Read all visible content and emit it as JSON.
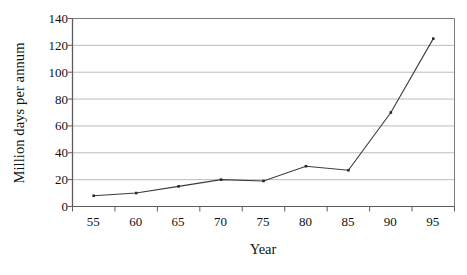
{
  "chart_data": {
    "type": "line",
    "title": "",
    "xlabel": "Year",
    "ylabel": "Million days per annum",
    "categories": [
      "55",
      "60",
      "65",
      "70",
      "75",
      "80",
      "85",
      "90",
      "95"
    ],
    "values": [
      8,
      10,
      15,
      20,
      19,
      30,
      27,
      70,
      125
    ],
    "series": [
      {
        "name": "Million days per annum",
        "values": [
          8,
          10,
          15,
          20,
          19,
          30,
          27,
          70,
          125
        ]
      }
    ],
    "ylim": [
      0,
      140
    ],
    "yticks": [
      0,
      20,
      40,
      60,
      80,
      100,
      120,
      140
    ],
    "ytick_labels": [
      "0",
      "20",
      "40",
      "60",
      "80",
      "100",
      "120",
      "140"
    ],
    "grid": true,
    "grid_axis": "y",
    "legend": false,
    "legend_position": "none",
    "marker": "square",
    "line_color": "#3b3b3b",
    "marker_color": "#2b2b2b",
    "grid_color": "#b4b4b4",
    "axis_color": "#7a7a7a",
    "background": "#ffffff"
  }
}
